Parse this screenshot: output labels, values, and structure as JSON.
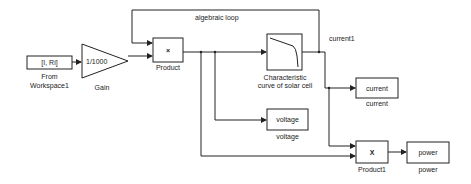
{
  "diagram": {
    "annotation": "algebraic loop",
    "signal_label": "current1",
    "blocks": {
      "from_workspace": {
        "content": "[I, Ri]",
        "name_line1": "From",
        "name_line2": "Workspace1"
      },
      "gain": {
        "content": "1/1000",
        "name": "Gain"
      },
      "product": {
        "content": "×",
        "name": "Product"
      },
      "characteristic": {
        "name_line1": "Characteristic",
        "name_line2": "curve of solar cell"
      },
      "current": {
        "content": "current",
        "name": "current"
      },
      "voltage": {
        "content": "voltage",
        "name": "voltage"
      },
      "product1": {
        "content": "X",
        "name": "Product1"
      },
      "power": {
        "content": "power",
        "name": "power"
      }
    }
  }
}
